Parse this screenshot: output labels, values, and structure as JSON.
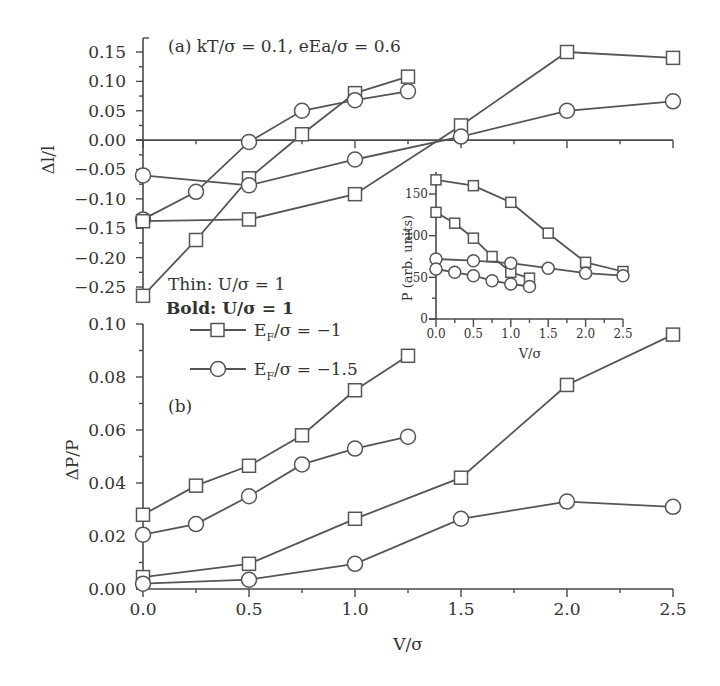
{
  "chart_data": [
    {
      "id": "panel_a",
      "type": "line",
      "title": "(a) kT/σ = 0.1, eEa/σ = 0.6",
      "xlabel": "",
      "ylabel": "Δl/l",
      "xlim": [
        0,
        2.5
      ],
      "ylim": [
        -0.275,
        0.165
      ],
      "yticks": [
        0.15,
        0.1,
        0.05,
        0.0,
        -0.05,
        -0.1,
        -0.15,
        -0.2,
        -0.25
      ],
      "ytick_labels": [
        "0.15",
        "0.10",
        "0.05",
        "0.00",
        "−0.05",
        "−0.10",
        "−0.15",
        "−0.20",
        "−0.25"
      ],
      "xticks": [
        0,
        0.5,
        1.0,
        1.5,
        2.0,
        2.5
      ],
      "zero_line": true,
      "series": [
        {
          "name": "EF/σ = −1 (short)",
          "marker": "square",
          "x": [
            0,
            0.25,
            0.5,
            0.75,
            1.0,
            1.25
          ],
          "values": [
            -0.265,
            -0.17,
            -0.065,
            0.01,
            0.08,
            0.108
          ]
        },
        {
          "name": "EF/σ = −1.5 (short)",
          "marker": "circle",
          "x": [
            0,
            0.25,
            0.5,
            0.75,
            1.0,
            1.25
          ],
          "values": [
            -0.135,
            -0.088,
            -0.003,
            0.05,
            0.068,
            0.083
          ]
        },
        {
          "name": "EF/σ = −1 (long)",
          "marker": "square",
          "x": [
            0,
            0.5,
            1.0,
            1.5,
            2.0,
            2.5
          ],
          "values": [
            -0.138,
            -0.135,
            -0.092,
            0.025,
            0.15,
            0.14
          ]
        },
        {
          "name": "EF/σ = −1.5 (long)",
          "marker": "circle",
          "x": [
            0,
            0.5,
            1.0,
            1.5,
            2.0,
            2.5
          ],
          "values": [
            -0.06,
            -0.077,
            -0.033,
            0.006,
            0.05,
            0.066
          ]
        }
      ]
    },
    {
      "id": "panel_b",
      "type": "line",
      "title": "(b)",
      "xlabel": "V/σ",
      "ylabel": "ΔP/P",
      "xlim": [
        0,
        2.5
      ],
      "ylim": [
        0,
        0.1
      ],
      "yticks": [
        0.0,
        0.02,
        0.04,
        0.06,
        0.08,
        0.1
      ],
      "ytick_labels": [
        "0.00",
        "0.02",
        "0.04",
        "0.06",
        "0.08",
        "0.10"
      ],
      "xticks": [
        0,
        0.5,
        1.0,
        1.5,
        2.0,
        2.5
      ],
      "xtick_labels": [
        "0.0",
        "0.5",
        "1.0",
        "1.5",
        "2.0",
        "2.5"
      ],
      "series": [
        {
          "name": "EF/σ = −1 (short)",
          "marker": "square",
          "x": [
            0,
            0.25,
            0.5,
            0.75,
            1.0,
            1.25
          ],
          "values": [
            0.028,
            0.039,
            0.0465,
            0.058,
            0.075,
            0.088
          ]
        },
        {
          "name": "EF/σ = −1.5 (short)",
          "marker": "circle",
          "x": [
            0,
            0.25,
            0.5,
            0.75,
            1.0,
            1.25
          ],
          "values": [
            0.0205,
            0.0245,
            0.035,
            0.047,
            0.053,
            0.0575
          ]
        },
        {
          "name": "EF/σ = −1 (long)",
          "marker": "square",
          "x": [
            0,
            0.5,
            1.0,
            1.5,
            2.0,
            2.5
          ],
          "values": [
            0.0045,
            0.0095,
            0.0265,
            0.042,
            0.077,
            0.096
          ]
        },
        {
          "name": "EF/σ = −1.5 (long)",
          "marker": "circle",
          "x": [
            0,
            0.5,
            1.0,
            1.5,
            2.0,
            2.5
          ],
          "values": [
            0.002,
            0.0035,
            0.0095,
            0.0265,
            0.033,
            0.031
          ]
        }
      ]
    },
    {
      "id": "inset",
      "type": "line",
      "title": "",
      "xlabel": "V/σ",
      "ylabel": "P (arb. units)",
      "xlim": [
        0,
        2.5
      ],
      "ylim": [
        0,
        180
      ],
      "yticks": [
        0,
        50,
        100,
        150
      ],
      "ytick_labels": [
        "0",
        "50",
        "100",
        "150"
      ],
      "xticks": [
        0,
        0.5,
        1.0,
        1.5,
        2.0,
        2.5
      ],
      "xtick_labels": [
        "0.0",
        "0.5",
        "1.0",
        "1.5",
        "2.0",
        "2.5"
      ],
      "series": [
        {
          "name": "EF/σ = −1 (long)",
          "marker": "square",
          "x": [
            0,
            0.5,
            1.0,
            1.5,
            2.0,
            2.5
          ],
          "values": [
            167,
            160,
            140,
            103,
            68,
            57
          ]
        },
        {
          "name": "EF/σ = −1 (short)",
          "marker": "square",
          "x": [
            0,
            0.25,
            0.5,
            0.75,
            1.0,
            1.25
          ],
          "values": [
            128,
            115,
            97,
            75,
            56,
            49
          ]
        },
        {
          "name": "EF/σ = −1.5 (long)",
          "marker": "circle",
          "x": [
            0,
            0.5,
            1.0,
            1.5,
            2.0,
            2.5
          ],
          "values": [
            72,
            70,
            67,
            61,
            55,
            52
          ]
        },
        {
          "name": "EF/σ = −1.5 (short)",
          "marker": "circle",
          "x": [
            0,
            0.25,
            0.5,
            0.75,
            1.0,
            1.25
          ],
          "values": [
            60,
            56,
            52,
            46,
            42,
            39
          ]
        }
      ]
    }
  ],
  "legend": {
    "thin": "Thin: U/σ = 1",
    "bold": "Bold: U/σ = 1",
    "entries": [
      {
        "marker": "square",
        "label_main": "E",
        "label_sub": "F",
        "label_rest": "/σ = −1"
      },
      {
        "marker": "circle",
        "label_main": "E",
        "label_sub": "F",
        "label_rest": "/σ = −1.5"
      }
    ]
  },
  "labels": {
    "panel_a_title": "(a) kT/σ = 0.1, eEa/σ = 0.6",
    "panel_a_ylabel": "Δl/l",
    "panel_b_title": "(b)",
    "panel_b_ylabel": "ΔP/P",
    "xlabel": "V/σ",
    "inset_ylabel": "P (arb. units)",
    "inset_xlabel": "V/σ"
  }
}
